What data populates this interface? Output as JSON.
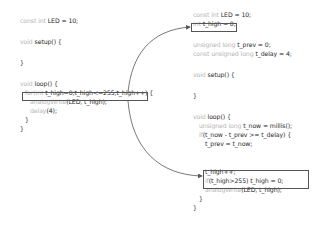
{
  "left_code": {
    "lines": [
      {
        "kw": "const int ",
        "rest": "LED = 10;",
        "y": 21,
        "x": 20
      },
      {
        "kw": "void ",
        "rest": "setup() {",
        "y": 42,
        "x": 20
      },
      {
        "kw": "",
        "rest": "}",
        "y": 63,
        "x": 20
      },
      {
        "kw": "void ",
        "rest": "loop() {",
        "y": 84,
        "x": 20
      },
      {
        "kw": "for(int ",
        "rest": "t_high=0;t_high<=255;t_high++) {",
        "y": 93,
        "x": 25
      },
      {
        "kw": "analogWrite",
        "rest": "(LED, t_high);",
        "y": 102,
        "x": 30
      },
      {
        "kw": "delay",
        "rest": "(4);",
        "y": 111,
        "x": 30
      },
      {
        "kw": "",
        "rest": "}",
        "y": 120,
        "x": 25
      },
      {
        "kw": "",
        "rest": "}",
        "y": 129,
        "x": 20
      }
    ]
  },
  "right_code": {
    "lines": [
      {
        "kw": "const int ",
        "rest": "LED = 10;",
        "y": 15,
        "x": 193
      },
      {
        "kw": "int ",
        "rest": "t_high = 0;",
        "y": 24,
        "x": 193
      },
      {
        "kw": "unsigned long ",
        "rest": "t_prev = 0;",
        "y": 45,
        "x": 193
      },
      {
        "kw": "const unsigned long ",
        "rest": "t_delay = 4;",
        "y": 54,
        "x": 193
      },
      {
        "kw": "void ",
        "rest": "setup() {",
        "y": 75,
        "x": 193
      },
      {
        "kw": "",
        "rest": "}",
        "y": 96,
        "x": 193
      },
      {
        "kw": "void ",
        "rest": "loop() {",
        "y": 117,
        "x": 193
      },
      {
        "kw": "unsigned long ",
        "rest": "t_now = millis();",
        "y": 126,
        "x": 199
      },
      {
        "kw": "if",
        "rest": "(t_now - t_prev >= t_delay) {",
        "y": 135,
        "x": 199
      },
      {
        "kw": "",
        "rest": "t_prev = t_now;",
        "y": 144,
        "x": 205
      },
      {
        "kw": "",
        "rest": "t_high++;",
        "y": 172,
        "x": 205
      },
      {
        "kw": "if",
        "rest": "(t_high>255) t_high = 0;",
        "y": 181,
        "x": 205
      },
      {
        "kw": "analogWrite",
        "rest": "(LED, t_high);",
        "y": 190,
        "x": 205
      },
      {
        "kw": "",
        "rest": "}",
        "y": 199,
        "x": 199
      },
      {
        "kw": "",
        "rest": "}",
        "y": 208,
        "x": 193
      }
    ]
  },
  "highlights": [
    {
      "name": "for-loop-box",
      "x": 22,
      "y": 92,
      "w": 126,
      "h": 9
    },
    {
      "name": "t-high-declaration-box",
      "x": 191,
      "y": 23,
      "w": 46,
      "h": 9
    },
    {
      "name": "t-high-update-box",
      "x": 203,
      "y": 170,
      "w": 106,
      "h": 19
    }
  ],
  "colors": {
    "keyword": "#b5b5b5",
    "text": "#2a2a2a",
    "arrow": "#555555"
  }
}
